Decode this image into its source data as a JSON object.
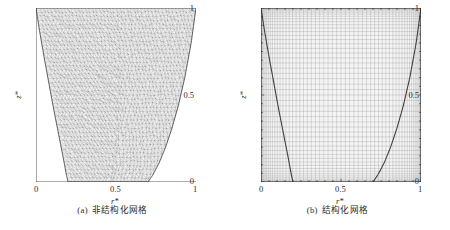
{
  "figure": {
    "type": "mesh-comparison-figure",
    "panels": [
      {
        "id": "a",
        "caption_index": "(a)",
        "caption_text": "非结构化网格",
        "mesh_type": "unstructured-triangular",
        "axes": {
          "xlabel": "r*",
          "ylabel": "z*",
          "xticks": [
            "0",
            "0.5",
            "1"
          ],
          "yticks": [
            "0",
            "0.5",
            "1"
          ],
          "xlim": [
            0,
            1
          ],
          "ylim": [
            0,
            1
          ]
        }
      },
      {
        "id": "b",
        "caption_index": "(b)",
        "caption_text": "结构化网格",
        "mesh_type": "structured-rectangular",
        "axes": {
          "xlabel": "r*",
          "ylabel": "z*",
          "xticks": [
            "0",
            "0.5",
            "1"
          ],
          "yticks": [
            "0",
            "0.5",
            "1"
          ],
          "xlim": [
            0,
            1
          ],
          "ylim": [
            0,
            1
          ]
        }
      }
    ],
    "bottom_partial_text": "",
    "colors": {
      "mesh_line": "#8a8a8a",
      "boundary_line": "#4a4a4a",
      "axis_line": "#2b2b2b",
      "background": "#ffffff",
      "fill": "#f2f2f2"
    }
  },
  "chart_data": [
    {
      "type": "line",
      "id": "panel-a-unstructured-mesh",
      "title": "(a) 非结构化网格",
      "xlabel": "r*",
      "ylabel": "z*",
      "xlim": [
        0,
        1
      ],
      "ylim": [
        0,
        1
      ],
      "grid": false,
      "legend": "none",
      "xticks": [
        0,
        0.5,
        1
      ],
      "yticks": [
        0,
        0.5,
        1
      ],
      "description": "Unstructured triangular mesh filling a funnel-shaped domain bounded left and right by curved free surfaces, flat bottom between r*=0.20 and r*=0.70, top edge spanning r*=0 to r*=1.",
      "series": [
        {
          "name": "left-boundary",
          "x": [
            0.0,
            0.02,
            0.05,
            0.08,
            0.11,
            0.14,
            0.17,
            0.19,
            0.2
          ],
          "y": [
            1.0,
            0.88,
            0.72,
            0.57,
            0.42,
            0.28,
            0.14,
            0.04,
            0.0
          ]
        },
        {
          "name": "right-boundary",
          "x": [
            1.0,
            0.97,
            0.93,
            0.89,
            0.85,
            0.81,
            0.77,
            0.73,
            0.7
          ],
          "y": [
            1.0,
            0.8,
            0.6,
            0.44,
            0.31,
            0.2,
            0.11,
            0.04,
            0.0
          ]
        },
        {
          "name": "bottom-boundary",
          "x": [
            0.2,
            0.7
          ],
          "y": [
            0.0,
            0.0
          ]
        },
        {
          "name": "top-boundary",
          "x": [
            0.0,
            1.0
          ],
          "y": [
            1.0,
            1.0
          ]
        }
      ]
    },
    {
      "type": "line",
      "id": "panel-b-structured-mesh",
      "title": "(b) 结构化网格",
      "xlabel": "r*",
      "ylabel": "z*",
      "xlim": [
        0,
        1
      ],
      "ylim": [
        0,
        1
      ],
      "grid": true,
      "legend": "none",
      "xticks": [
        0,
        0.5,
        1
      ],
      "yticks": [
        0,
        0.5,
        1
      ],
      "description": "Structured rectangular Cartesian grid covering the whole unit square, with the same two boundary curves overlaid; grid lines are clustered near the left and right walls.",
      "series": [
        {
          "name": "left-boundary",
          "x": [
            0.0,
            0.02,
            0.05,
            0.08,
            0.11,
            0.14,
            0.17,
            0.19,
            0.2
          ],
          "y": [
            1.0,
            0.88,
            0.72,
            0.57,
            0.42,
            0.28,
            0.14,
            0.04,
            0.0
          ]
        },
        {
          "name": "right-boundary",
          "x": [
            1.0,
            0.97,
            0.93,
            0.89,
            0.85,
            0.81,
            0.77,
            0.73,
            0.7
          ],
          "y": [
            1.0,
            0.8,
            0.6,
            0.44,
            0.31,
            0.2,
            0.11,
            0.04,
            0.0
          ]
        }
      ]
    }
  ]
}
